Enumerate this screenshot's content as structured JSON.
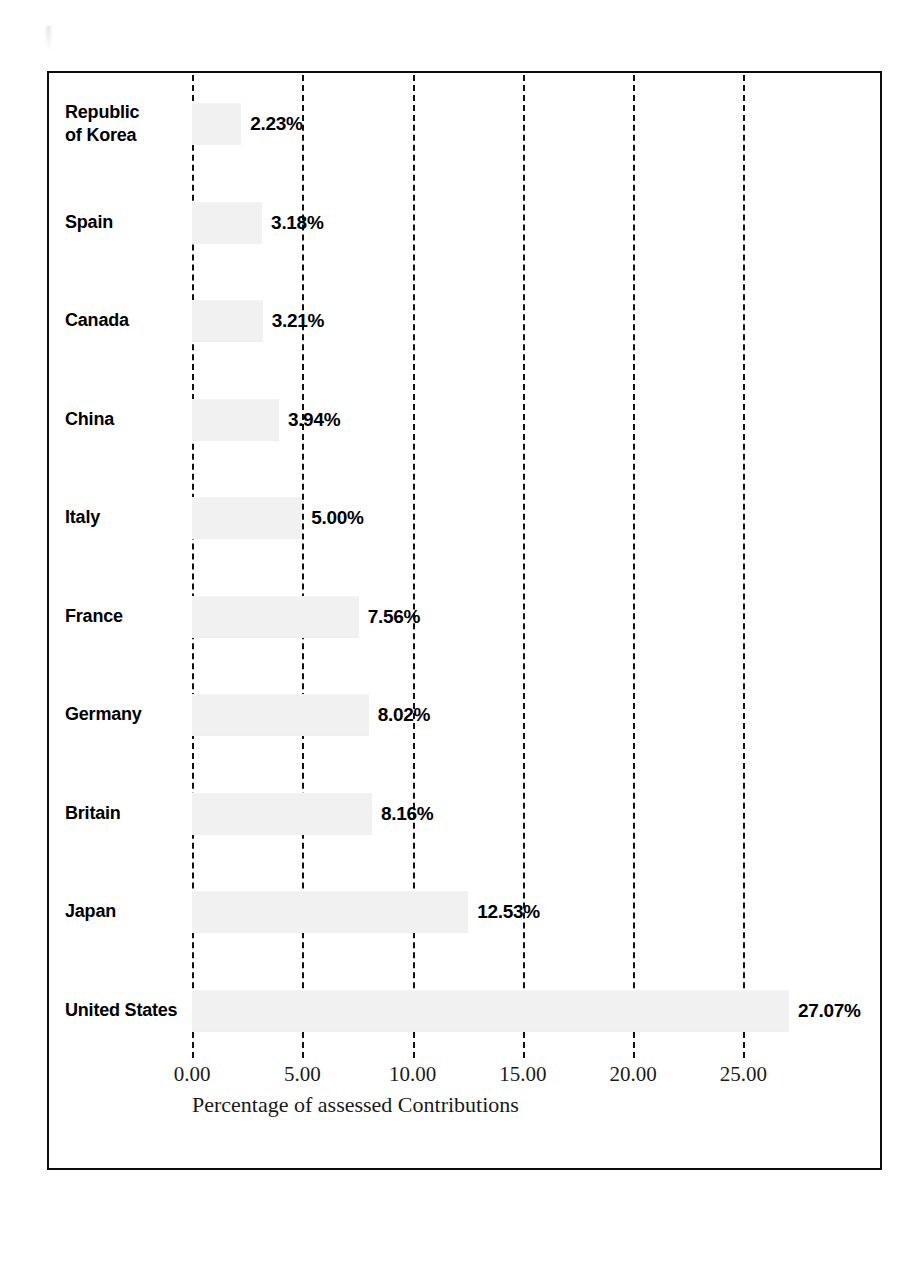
{
  "chart_data": {
    "type": "bar",
    "orientation": "horizontal",
    "title": "",
    "xlabel": "Percentage of assessed Contributions",
    "ylabel": "",
    "categories": [
      "Republic of Korea",
      "Spain",
      "Canada",
      "China",
      "Italy",
      "France",
      "Germany",
      "Britain",
      "Japan",
      "United States"
    ],
    "values": [
      2.23,
      3.18,
      3.21,
      3.94,
      5.0,
      7.56,
      8.02,
      8.16,
      12.53,
      27.07
    ],
    "data_labels": [
      "2.23%",
      "3.18%",
      "3.21%",
      "3.94%",
      "5.00%",
      "7.56%",
      "8.02%",
      "8.16%",
      "12.53%",
      "27.07%"
    ],
    "xlim": [
      0,
      30
    ],
    "xticks": [
      0,
      5,
      10,
      15,
      20,
      25
    ],
    "xtick_labels": [
      "0.00",
      "5.00",
      "10.00",
      "15.00",
      "20.00",
      "25.00"
    ],
    "grid": "vertical-dashed",
    "legend": "none",
    "bar_color": "#f1f1f1",
    "frame_color": "#0d0d0d",
    "label_color": "#000000"
  },
  "chart": {
    "rows": [
      {
        "label_line1": "Republic",
        "label_line2": "of Korea",
        "value_label": "2.23%",
        "value": 2.23
      },
      {
        "label_line1": "Spain",
        "label_line2": "",
        "value_label": "3.18%",
        "value": 3.18
      },
      {
        "label_line1": "Canada",
        "label_line2": "",
        "value_label": "3.21%",
        "value": 3.21
      },
      {
        "label_line1": "China",
        "label_line2": "",
        "value_label": "3.94%",
        "value": 3.94
      },
      {
        "label_line1": "Italy",
        "label_line2": "",
        "value_label": "5.00%",
        "value": 5.0
      },
      {
        "label_line1": "France",
        "label_line2": "",
        "value_label": "7.56%",
        "value": 7.56
      },
      {
        "label_line1": "Germany",
        "label_line2": "",
        "value_label": "8.02%",
        "value": 8.02
      },
      {
        "label_line1": "Britain",
        "label_line2": "",
        "value_label": "8.16%",
        "value": 8.16
      },
      {
        "label_line1": "Japan",
        "label_line2": "",
        "value_label": "12.53%",
        "value": 12.53
      },
      {
        "label_line1": "United States",
        "label_line2": "",
        "value_label": "27.07%",
        "value": 27.07
      }
    ],
    "axis": {
      "ticks": [
        {
          "label": "0.00",
          "value": 0
        },
        {
          "label": "5.00",
          "value": 5
        },
        {
          "label": "10.00",
          "value": 10
        },
        {
          "label": "15.00",
          "value": 15
        },
        {
          "label": "20.00",
          "value": 20
        },
        {
          "label": "25.00",
          "value": 25
        }
      ],
      "title": "Percentage of assessed Contributions"
    }
  }
}
